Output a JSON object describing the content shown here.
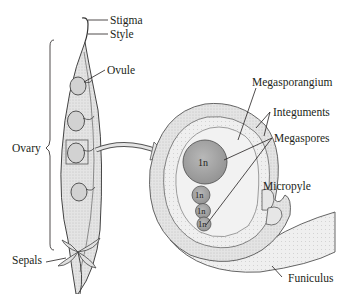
{
  "diagram": {
    "type": "botanical-illustration",
    "colors": {
      "tissue": "#dcdcdc",
      "tissue_light": "#ececec",
      "megaspore_fill": "#a9a9a9",
      "outline": "#4a4a4a",
      "ink": "#231f20"
    },
    "pistil_labels": {
      "stigma": "Stigma",
      "style": "Style",
      "ovule": "Ovule",
      "ovary": "Ovary",
      "sepals": "Sepals"
    },
    "ovule_labels": {
      "megasporangium": "Megasporangium",
      "integuments": "Integuments",
      "megaspores": "Megaspores",
      "micropyle": "Micropyle",
      "funiculus": "Funiculus"
    },
    "megaspores": [
      {
        "ploidy": "1n"
      },
      {
        "ploidy": "1n"
      },
      {
        "ploidy": "1n"
      },
      {
        "ploidy": "1n"
      }
    ]
  }
}
